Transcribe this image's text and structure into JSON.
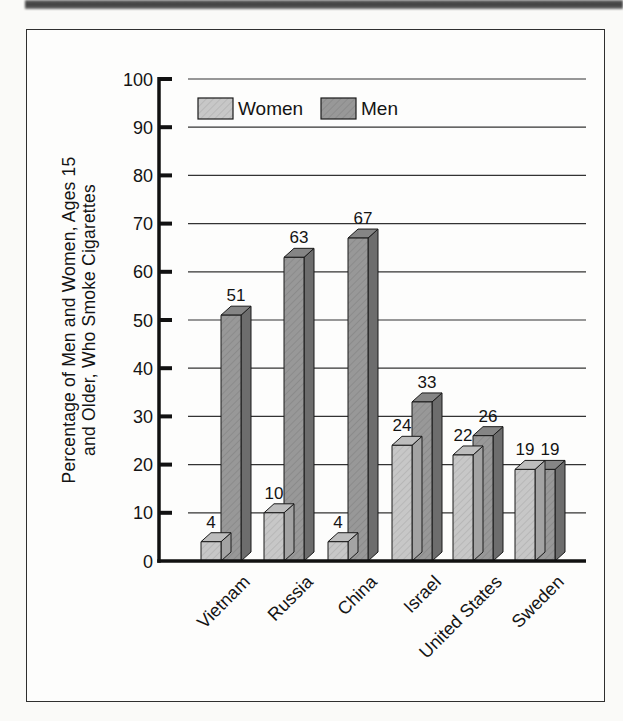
{
  "page": {
    "background": "#fafaf8"
  },
  "decorations": {
    "top_strip_color": "#474747",
    "figure_border_color": "#2f2f2f",
    "figure_background": "#fdfdfc"
  },
  "chart_data": {
    "type": "bar",
    "style": "3d-grouped",
    "title": "",
    "ylabel": "Percentage of Men and Women, Ages 15 and Older, Who Smoke Cigarettes",
    "ylabel_lines": [
      "Percentage of Men and Women, Ages 15",
      "and Older, Who Smoke Cigarettes"
    ],
    "xlabel": "",
    "categories": [
      "Vietnam",
      "Russia",
      "China",
      "Israel",
      "United States",
      "Sweden"
    ],
    "series": [
      {
        "name": "Women",
        "values": [
          4,
          10,
          4,
          24,
          22,
          19
        ],
        "colors": {
          "front": "#c7c7c7",
          "top": "#bdbdbd",
          "side": "#a3a3a3"
        }
      },
      {
        "name": "Men",
        "values": [
          51,
          63,
          67,
          33,
          26,
          19
        ],
        "colors": {
          "front": "#989898",
          "top": "#858585",
          "side": "#6d6d6d"
        }
      }
    ],
    "ylim": [
      0,
      100
    ],
    "yticks": [
      0,
      10,
      20,
      30,
      40,
      50,
      60,
      70,
      80,
      90,
      100
    ],
    "grid": true,
    "bar_value_labels_visible": true,
    "legend": {
      "entries": [
        "Women",
        "Men"
      ],
      "position": "top-left-inside"
    },
    "line_colors": {
      "outline": "#1a1a1a",
      "grid": "#333333",
      "axis": "#111111"
    }
  }
}
